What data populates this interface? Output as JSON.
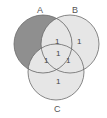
{
  "diagram": {
    "type": "venn-3",
    "sets": [
      {
        "label": "A",
        "shaded": true
      },
      {
        "label": "B",
        "shaded": false
      },
      {
        "label": "C",
        "shaded": false
      }
    ],
    "regions": {
      "b_only": "1",
      "ab_only": "1",
      "abc": "1",
      "ac_only": "1",
      "bc_only": "1",
      "c_only": "1"
    },
    "colors": {
      "shaded": "#8f8f8f",
      "light": "#e6e6e6",
      "stroke": "#6a6a6a"
    }
  }
}
